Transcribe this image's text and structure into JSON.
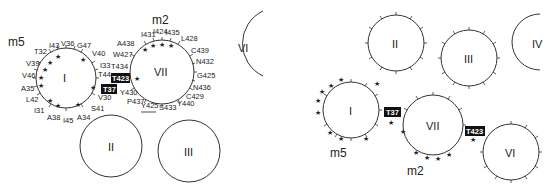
{
  "left_panel": {
    "m5_label": "m5",
    "m2_label": "m2",
    "helix_I": "I",
    "helix_VII": "VII",
    "helix_VI": "VI",
    "helix_II": "II",
    "helix_III": "III",
    "boxed_T423": "T423",
    "boxed_T37": "T37",
    "residues_I": [
      "T32",
      "I43",
      "V36",
      "G47",
      "V40",
      "I33",
      "T44",
      "V30",
      "S41",
      "A34",
      "I45",
      "A38",
      "I31",
      "L42",
      "A35",
      "V46",
      "V39"
    ],
    "residues_VII": [
      "A438",
      "I431",
      "I424",
      "I435",
      "L428",
      "C439",
      "N432",
      "G425",
      "N436",
      "C429",
      "Y440",
      "S433",
      "Y425",
      "P437",
      "Y430",
      "T434",
      "W427"
    ],
    "underlined_residue": "Y425"
  },
  "right_panel": {
    "m5_label": "m5",
    "m2_label": "m2",
    "helix_I": "I",
    "helix_II": "II",
    "helix_III": "III",
    "helix_IV": "IV",
    "helix_VI": "VI",
    "helix_VII": "VII",
    "boxed_T37": "T37",
    "boxed_T423": "T423"
  },
  "colors": {
    "line": "#333333",
    "box_fill": "#111111",
    "box_text": "#ffffff"
  }
}
